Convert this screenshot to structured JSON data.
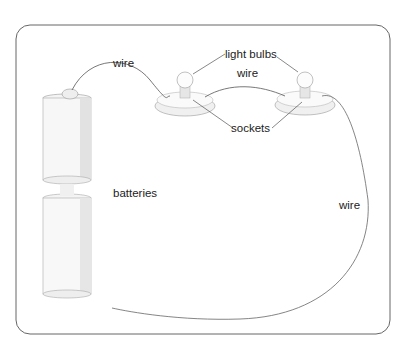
{
  "diagram": {
    "labels": {
      "wire_top_left": "wire",
      "light_bulbs": "light bulbs",
      "wire_middle": "wire",
      "sockets": "sockets",
      "batteries": "batteries",
      "wire_right": "wire"
    },
    "components": [
      "batteries",
      "light bulbs",
      "sockets",
      "wire"
    ],
    "colors": {
      "frame": "#555555",
      "line": "#444444",
      "shade": "#cccccc"
    }
  }
}
